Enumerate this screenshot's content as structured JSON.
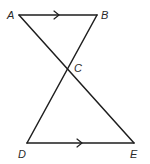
{
  "diagram": {
    "type": "geometry",
    "points": {
      "A": {
        "label": "A",
        "x": 19,
        "y": 15,
        "label_x": 7,
        "label_y": 19
      },
      "B": {
        "label": "B",
        "x": 97,
        "y": 15,
        "label_x": 101,
        "label_y": 19
      },
      "C": {
        "label": "C",
        "x": 68,
        "y": 69,
        "label_x": 74,
        "label_y": 72
      },
      "D": {
        "label": "D",
        "x": 27,
        "y": 143,
        "label_x": 18,
        "label_y": 158
      },
      "E": {
        "label": "E",
        "x": 134,
        "y": 143,
        "label_x": 130,
        "label_y": 158
      }
    },
    "segments": [
      {
        "name": "AB",
        "from": "A",
        "to": "B",
        "parallel_marker": true
      },
      {
        "name": "DE",
        "from": "D",
        "to": "E",
        "parallel_marker": true
      },
      {
        "name": "AE",
        "from": "A",
        "to": "E",
        "parallel_marker": false
      },
      {
        "name": "BD",
        "from": "B",
        "to": "D",
        "parallel_marker": false
      }
    ],
    "stroke_color": "#1e1e1e",
    "label_color": "#2a2a2a",
    "background": "#ffffff"
  }
}
